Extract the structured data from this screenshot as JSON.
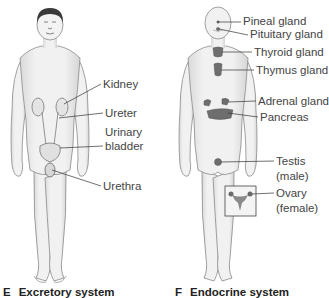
{
  "panels": [
    {
      "letter": "E",
      "title": "Excretory system",
      "labels": {
        "kidney": "Kidney",
        "ureter": "Ureter",
        "urinary": "Urinary",
        "bladder": "bladder",
        "urethra": "Urethra"
      }
    },
    {
      "letter": "F",
      "title": "Endocrine system",
      "labels": {
        "pineal": "Pineal gland",
        "pituitary": "Pituitary gland",
        "thyroid": "Thyroid gland",
        "thymus": "Thymus gland",
        "adrenal": "Adrenal gland",
        "pancreas": "Pancreas",
        "testis": "Testis",
        "male": "(male)",
        "ovary": "Ovary",
        "female": "(female)"
      }
    }
  ],
  "colors": {
    "skin": "#ececec",
    "outline": "#8a8a8a",
    "organ": "#7a7a7a",
    "hair": "#3a3a3a",
    "leader": "#333333"
  }
}
